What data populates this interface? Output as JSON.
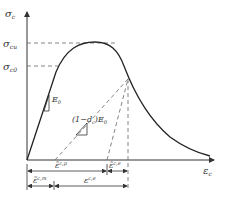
{
  "diagram": {
    "type": "stress-strain curve (concrete damage plasticity, compression)",
    "colors": {
      "curve": "#222222",
      "axes": "#333333",
      "dashed": "#666666",
      "text": "#333333"
    },
    "axes": {
      "y_label": "σ",
      "y_label_sub": "c",
      "x_label": "ε",
      "x_label_sub": "c"
    },
    "stress_levels": {
      "peak": {
        "symbol": "σ",
        "sub": "cu"
      },
      "initial": {
        "symbol": "σ",
        "sub": "c0"
      }
    },
    "slopes": {
      "elastic": {
        "text": "E",
        "sub": "0"
      },
      "unloading": {
        "prefix": "(1−d",
        "prefix_sub": "c",
        "suffix": ")E",
        "suffix_sub": "0"
      }
    },
    "dimensions": {
      "plastic_strain": {
        "symbol": "ε̃",
        "sup": "c,p"
      },
      "elastic_strain_unload": {
        "symbol": "ε̃",
        "sup": "c,e"
      },
      "elastic_strain_init": {
        "symbol": "ε̃",
        "sup": "c,m"
      },
      "elastic_strain": {
        "symbol": "ε",
        "sup": "c,e"
      }
    }
  }
}
